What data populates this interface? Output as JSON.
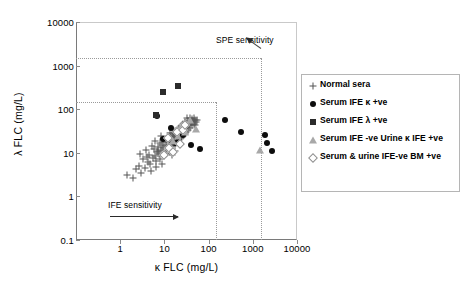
{
  "chart_data": {
    "type": "scatter",
    "title": "",
    "xlabel": "κ FLC (mg/L)",
    "ylabel": "λ FLC (mg/L)",
    "xscale": "log",
    "yscale": "log",
    "xlim": [
      0.1,
      10000
    ],
    "ylim": [
      0.1,
      10000
    ],
    "xticks": [
      "1",
      "10",
      "100",
      "1000",
      "10000"
    ],
    "xtick_values": [
      1,
      10,
      100,
      1000,
      10000
    ],
    "yticks": [
      "10000",
      "1000",
      "100",
      "10",
      "1",
      "0.1"
    ],
    "ytick_values": [
      10000,
      1000,
      100,
      10,
      1,
      0.1
    ],
    "grid": false,
    "legend_position": "right",
    "annotations": [
      {
        "text": "SPE sensitivity",
        "x": 1500,
        "y": 4000
      },
      {
        "text": "IFE sensitivity",
        "x": 12,
        "y": 0.45
      }
    ],
    "reference_lines": [
      {
        "orientation": "horizontal",
        "value": 1500,
        "label": "SPE sensitivity",
        "style": "dotted"
      },
      {
        "orientation": "horizontal",
        "value": 150,
        "label": "IFE sensitivity",
        "style": "dotted"
      },
      {
        "orientation": "vertical",
        "value": 1500,
        "label": "SPE sensitivity",
        "style": "dotted"
      },
      {
        "orientation": "vertical",
        "value": 150,
        "label": "IFE sensitivity",
        "style": "dotted"
      }
    ],
    "series": [
      {
        "name": "Normal sera",
        "marker": "plus",
        "color": "#555555",
        "points": [
          [
            1.4,
            3.1
          ],
          [
            1.9,
            2.6
          ],
          [
            2.3,
            4.2
          ],
          [
            3.0,
            3.4
          ],
          [
            2.6,
            5.0
          ],
          [
            3.6,
            4.6
          ],
          [
            4.2,
            6.0
          ],
          [
            3.3,
            7.2
          ],
          [
            4.8,
            5.4
          ],
          [
            5.4,
            7.8
          ],
          [
            4.4,
            9.0
          ],
          [
            6.0,
            8.4
          ],
          [
            6.8,
            10.5
          ],
          [
            5.8,
            12.0
          ],
          [
            7.6,
            9.4
          ],
          [
            8.4,
            11.5
          ],
          [
            7.2,
            13.8
          ],
          [
            9.4,
            12.6
          ],
          [
            10.4,
            10.0
          ],
          [
            9.0,
            15.5
          ],
          [
            11.5,
            13.5
          ],
          [
            10.0,
            17.5
          ],
          [
            12.6,
            15.0
          ],
          [
            11.0,
            19.5
          ],
          [
            13.8,
            16.8
          ],
          [
            12.0,
            21.5
          ],
          [
            15.2,
            18.5
          ],
          [
            13.2,
            23.5
          ],
          [
            16.8,
            20.5
          ],
          [
            14.5,
            26.0
          ],
          [
            18.5,
            22.5
          ],
          [
            16.0,
            28.5
          ],
          [
            20.5,
            25.0
          ],
          [
            17.5,
            31.0
          ],
          [
            22.5,
            27.5
          ],
          [
            19.5,
            34.0
          ],
          [
            25.0,
            30.0
          ],
          [
            21.5,
            37.5
          ],
          [
            27.5,
            33.0
          ],
          [
            24.0,
            41.0
          ],
          [
            30.0,
            36.0
          ],
          [
            26.5,
            45.0
          ],
          [
            33.0,
            40.0
          ],
          [
            29.0,
            49.0
          ],
          [
            36.5,
            44.0
          ],
          [
            40.0,
            48.0
          ],
          [
            44.0,
            53.0
          ],
          [
            48.0,
            58.0
          ],
          [
            35.0,
            55.0
          ],
          [
            52.0,
            50.0
          ],
          [
            6.4,
            6.6
          ],
          [
            8.0,
            7.4
          ],
          [
            9.8,
            8.6
          ],
          [
            7.0,
            11.0
          ],
          [
            11.0,
            9.6
          ],
          [
            12.4,
            11.2
          ],
          [
            10.6,
            14.2
          ],
          [
            14.0,
            12.4
          ],
          [
            13.0,
            18.0
          ],
          [
            15.8,
            14.6
          ],
          [
            17.0,
            16.2
          ],
          [
            14.8,
            20.0
          ],
          [
            19.0,
            17.8
          ],
          [
            16.5,
            23.0
          ],
          [
            21.0,
            19.8
          ],
          [
            18.0,
            25.5
          ],
          [
            23.5,
            22.0
          ],
          [
            20.0,
            29.0
          ],
          [
            26.0,
            24.5
          ],
          [
            22.0,
            32.5
          ],
          [
            28.5,
            27.0
          ],
          [
            24.5,
            36.0
          ],
          [
            31.5,
            30.5
          ],
          [
            27.0,
            40.0
          ],
          [
            34.5,
            34.0
          ],
          [
            38.0,
            38.0
          ],
          [
            42.0,
            42.5
          ],
          [
            46.0,
            46.5
          ],
          [
            30.0,
            52.0
          ],
          [
            50.0,
            44.0
          ],
          [
            5.0,
            3.8
          ],
          [
            6.6,
            4.8
          ],
          [
            8.8,
            5.6
          ],
          [
            4.0,
            8.0
          ],
          [
            7.8,
            16.5
          ],
          [
            9.2,
            20.5
          ],
          [
            11.8,
            24.5
          ],
          [
            13.5,
            28.0
          ],
          [
            15.0,
            9.0
          ],
          [
            17.8,
            11.0
          ],
          [
            2.8,
            9.2
          ],
          [
            3.8,
            11.8
          ],
          [
            5.2,
            14.0
          ],
          [
            6.2,
            18.5
          ],
          [
            8.2,
            24.0
          ],
          [
            43.0,
            60.0
          ],
          [
            38.0,
            62.0
          ],
          [
            55.0,
            56.0
          ],
          [
            33.0,
            64.0
          ],
          [
            47.0,
            64.0
          ]
        ]
      },
      {
        "name": "Serum IFE κ  +ve",
        "marker": "circle",
        "color": "#0d0d0d",
        "points": [
          [
            6.8,
            70.0
          ],
          [
            14.0,
            38.0
          ],
          [
            21.0,
            20.0
          ],
          [
            40.0,
            15.0
          ],
          [
            64.0,
            12.0
          ],
          [
            230.0,
            58.0
          ],
          [
            540.0,
            30.0
          ],
          [
            1900.0,
            26.0
          ],
          [
            2050.0,
            17.0
          ],
          [
            2700.0,
            11.0
          ],
          [
            26.0,
            26.0
          ],
          [
            17.5,
            17.0
          ],
          [
            9.5,
            21.0
          ]
        ]
      },
      {
        "name": "Serum IFE λ +ve",
        "marker": "square",
        "color": "#2b2b2b",
        "points": [
          [
            9.5,
            250.0
          ],
          [
            20.0,
            340.0
          ],
          [
            6.4,
            72.0
          ]
        ]
      },
      {
        "name": "Serum IFE -ve Urine κ IFE +ve",
        "marker": "triangle",
        "color": "#a8a8a8",
        "points": [
          [
            37.0,
            57.0
          ],
          [
            52.0,
            36.0
          ],
          [
            30.0,
            30.0
          ],
          [
            24.0,
            42.0
          ],
          [
            20.0,
            24.0
          ],
          [
            1450.0,
            11.5
          ],
          [
            16.0,
            19.0
          ]
        ]
      },
      {
        "name": "Serum & urine IFE-ve BM +ve",
        "marker": "diamond",
        "color": "#8f8f8f",
        "points": [
          [
            13.0,
            13.0
          ],
          [
            19.0,
            30.0
          ],
          [
            26.0,
            34.0
          ],
          [
            16.0,
            10.5
          ],
          [
            10.0,
            9.0
          ],
          [
            22.0,
            16.0
          ],
          [
            30.0,
            44.0
          ],
          [
            12.0,
            22.0
          ]
        ]
      }
    ]
  },
  "legend": {
    "items": [
      {
        "label": "Normal sera",
        "marker": "plus"
      },
      {
        "label": "Serum IFE κ  +ve",
        "marker": "circle"
      },
      {
        "label": "Serum IFE λ +ve",
        "marker": "square"
      },
      {
        "label": "Serum IFE -ve Urine κ IFE +ve",
        "marker": "triangle"
      },
      {
        "label": "Serum & urine IFE-ve BM +ve",
        "marker": "diamond"
      }
    ]
  }
}
